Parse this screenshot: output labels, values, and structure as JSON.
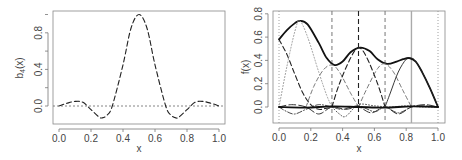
{
  "chart_data": [
    {
      "type": "line",
      "title": "",
      "xlabel": "x",
      "ylabel": "b4(x)",
      "ylabel_main": "b",
      "ylabel_sub": "4",
      "ylabel_tail": "(x)",
      "xlim": [
        0,
        1
      ],
      "ylim": [
        -0.15,
        1.02
      ],
      "xticks": [
        "0.0",
        "0.2",
        "0.4",
        "0.6",
        "0.8",
        "1.0"
      ],
      "yticks": [
        "0.0",
        "0.4",
        "0.8"
      ],
      "grid": false,
      "reference_line": {
        "y": 0,
        "style": "dotted"
      },
      "series": [
        {
          "name": "b4(x)",
          "style": "dashed",
          "x": [
            0.0,
            0.05,
            0.1,
            0.15,
            0.2,
            0.25,
            0.27,
            0.3,
            0.333,
            0.4,
            0.45,
            0.5,
            0.55,
            0.6,
            0.667,
            0.7,
            0.73,
            0.75,
            0.8,
            0.85,
            0.9,
            0.95,
            1.0
          ],
          "y": [
            0.0,
            0.03,
            0.05,
            0.04,
            -0.04,
            -0.12,
            -0.13,
            -0.1,
            0.0,
            0.45,
            0.85,
            1.0,
            0.85,
            0.45,
            0.0,
            -0.1,
            -0.13,
            -0.12,
            -0.04,
            0.04,
            0.05,
            0.03,
            0.0
          ]
        }
      ]
    },
    {
      "type": "line",
      "title": "",
      "xlabel": "x",
      "ylabel": "f(x)",
      "xlim": [
        0,
        1
      ],
      "ylim": [
        -0.1,
        0.82
      ],
      "xticks": [
        "0.0",
        "0.2",
        "0.4",
        "0.6",
        "0.8",
        "1.0"
      ],
      "yticks": [
        "0.0",
        "0.2",
        "0.4",
        "0.6",
        "0.8"
      ],
      "grid": false,
      "vertical_lines": [
        {
          "x": 0.0,
          "style": "dotted"
        },
        {
          "x": 0.333,
          "style": "dashed-gray"
        },
        {
          "x": 0.5,
          "style": "dashed"
        },
        {
          "x": 0.667,
          "style": "dashed-gray"
        },
        {
          "x": 0.833,
          "style": "solid-gray"
        },
        {
          "x": 1.0,
          "style": "dotted"
        }
      ],
      "series": [
        {
          "name": "f(x)",
          "style": "solid-thick",
          "x": [
            0.0,
            0.05,
            0.1,
            0.13,
            0.18,
            0.25,
            0.3,
            0.35,
            0.4,
            0.45,
            0.51,
            0.57,
            0.62,
            0.68,
            0.74,
            0.78,
            0.82,
            0.86,
            0.9,
            0.95,
            1.0
          ],
          "y": [
            0.58,
            0.66,
            0.72,
            0.74,
            0.71,
            0.55,
            0.42,
            0.36,
            0.39,
            0.47,
            0.51,
            0.48,
            0.41,
            0.37,
            0.39,
            0.41,
            0.42,
            0.39,
            0.3,
            0.16,
            0.0
          ]
        },
        {
          "name": "basis-1",
          "style": "dashed",
          "x": [
            0.0,
            0.05,
            0.1,
            0.15,
            0.2,
            0.25,
            0.3,
            0.35
          ],
          "y": [
            0.58,
            0.45,
            0.28,
            0.12,
            0.02,
            -0.02,
            -0.01,
            0.0
          ]
        },
        {
          "name": "basis-2",
          "style": "dotted-gray",
          "x": [
            0.0,
            0.05,
            0.1,
            0.13,
            0.18,
            0.25,
            0.3,
            0.333
          ],
          "y": [
            0.0,
            0.35,
            0.65,
            0.74,
            0.6,
            0.3,
            0.1,
            0.0
          ]
        },
        {
          "name": "basis-3",
          "style": "dashed-gray",
          "x": [
            0.17,
            0.22,
            0.28,
            0.333,
            0.38,
            0.45,
            0.5
          ],
          "y": [
            0.0,
            0.18,
            0.32,
            0.36,
            0.3,
            0.12,
            0.0
          ]
        },
        {
          "name": "basis-4",
          "style": "dashed",
          "x": [
            0.333,
            0.38,
            0.45,
            0.5,
            0.55,
            0.62,
            0.667
          ],
          "y": [
            0.0,
            0.2,
            0.42,
            0.51,
            0.43,
            0.2,
            0.0
          ]
        },
        {
          "name": "basis-5",
          "style": "dashed-gray",
          "x": [
            0.5,
            0.55,
            0.62,
            0.667,
            0.72,
            0.78,
            0.833
          ],
          "y": [
            0.0,
            0.15,
            0.33,
            0.37,
            0.3,
            0.14,
            0.0
          ]
        },
        {
          "name": "basis-6",
          "style": "solid-thin",
          "x": [
            0.667,
            0.7,
            0.75,
            0.8,
            0.833,
            0.86,
            0.9,
            0.95,
            1.0
          ],
          "y": [
            0.0,
            0.12,
            0.3,
            0.41,
            0.42,
            0.39,
            0.3,
            0.16,
            0.0
          ]
        },
        {
          "name": "basis-7",
          "style": "dotdash",
          "x": [
            0.0,
            0.05,
            0.1,
            0.17,
            0.25,
            0.333,
            0.4,
            0.5,
            0.6,
            0.667,
            0.75,
            0.833,
            0.9,
            1.0
          ],
          "y": [
            0.0,
            -0.04,
            -0.06,
            -0.02,
            0.02,
            0.0,
            -0.02,
            0.01,
            -0.04,
            0.0,
            -0.05,
            0.0,
            0.01,
            0.0
          ]
        },
        {
          "name": "basis-8",
          "style": "dashed-long",
          "x": [
            0.0,
            0.08,
            0.17,
            0.25,
            0.333,
            0.42,
            0.5,
            0.58,
            0.667,
            0.75,
            0.833,
            0.92,
            1.0
          ],
          "y": [
            0.0,
            0.02,
            0.0,
            -0.06,
            0.0,
            -0.02,
            0.0,
            -0.05,
            0.0,
            -0.06,
            0.0,
            0.02,
            0.0
          ]
        },
        {
          "name": "basis-9",
          "style": "dotted",
          "x": [
            0.333,
            0.38,
            0.42,
            0.5,
            0.6,
            0.7,
            0.8,
            0.9,
            1.0
          ],
          "y": [
            0.0,
            -0.06,
            -0.08,
            0.02,
            0.01,
            0.0,
            0.01,
            0.0,
            0.0
          ]
        },
        {
          "name": "baseline-thick",
          "style": "solid-thick",
          "x": [
            0.0,
            0.17,
            0.333,
            0.5,
            0.667,
            0.833,
            1.0
          ],
          "y": [
            0.0,
            -0.005,
            0.005,
            0.0,
            -0.005,
            0.005,
            0.0
          ]
        }
      ]
    }
  ]
}
